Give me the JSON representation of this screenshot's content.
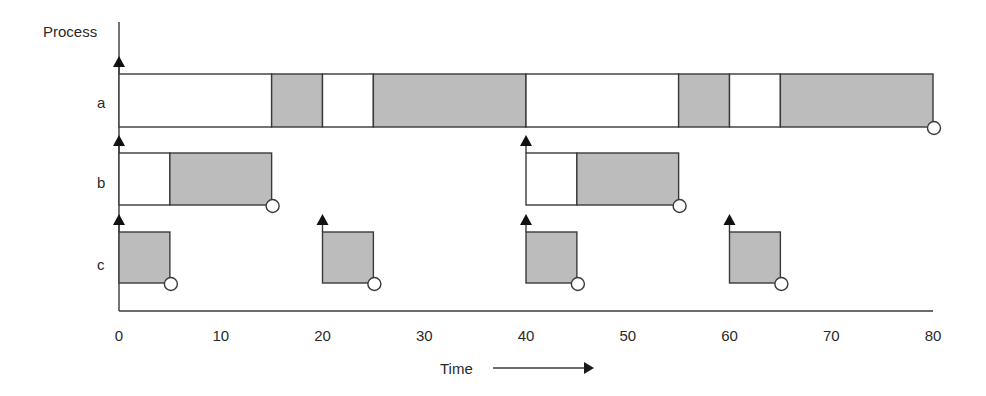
{
  "diagram": {
    "y_axis_label": "Process",
    "x_axis_label": "Time",
    "colors": {
      "running_fill": "#bcbcbc",
      "idle_fill": "#ffffff",
      "stroke": "#3a3a3a"
    }
  },
  "chart_data": {
    "type": "bar",
    "orientation": "horizontal-range",
    "title": "",
    "xlabel": "Time",
    "ylabel": "Process",
    "xlim": [
      0,
      80
    ],
    "x_ticks": [
      0,
      10,
      20,
      30,
      40,
      50,
      60,
      70,
      80
    ],
    "grid": false,
    "legend": null,
    "categories": [
      "a",
      "b",
      "c"
    ],
    "series": [
      {
        "name": "a",
        "segments": [
          {
            "start": 0,
            "end": 15,
            "state": "idle"
          },
          {
            "start": 15,
            "end": 20,
            "state": "running"
          },
          {
            "start": 20,
            "end": 25,
            "state": "idle"
          },
          {
            "start": 25,
            "end": 40,
            "state": "running"
          },
          {
            "start": 40,
            "end": 55,
            "state": "idle"
          },
          {
            "start": 55,
            "end": 60,
            "state": "running"
          },
          {
            "start": 60,
            "end": 65,
            "state": "idle"
          },
          {
            "start": 65,
            "end": 80,
            "state": "running"
          }
        ],
        "arrivals": [
          0
        ],
        "deadlines": [
          80
        ]
      },
      {
        "name": "b",
        "segments": [
          {
            "start": 0,
            "end": 5,
            "state": "idle"
          },
          {
            "start": 5,
            "end": 15,
            "state": "running"
          },
          {
            "start": 40,
            "end": 45,
            "state": "idle"
          },
          {
            "start": 45,
            "end": 55,
            "state": "running"
          }
        ],
        "arrivals": [
          0,
          40
        ],
        "deadlines": [
          15,
          55
        ]
      },
      {
        "name": "c",
        "segments": [
          {
            "start": 0,
            "end": 5,
            "state": "running"
          },
          {
            "start": 20,
            "end": 25,
            "state": "running"
          },
          {
            "start": 40,
            "end": 45,
            "state": "running"
          },
          {
            "start": 60,
            "end": 65,
            "state": "running"
          }
        ],
        "arrivals": [
          0,
          20,
          40,
          60
        ],
        "deadlines": [
          5,
          25,
          45,
          65
        ]
      }
    ],
    "annotations": {
      "arrival_marker": "filled up-arrow",
      "deadline_marker": "open circle"
    }
  }
}
